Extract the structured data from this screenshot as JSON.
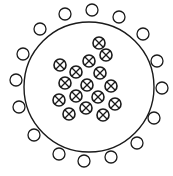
{
  "diagram": {
    "width": 173,
    "height": 176,
    "stroke_color": "#1a1a1a",
    "background": "#ffffff",
    "big_circle": {
      "cx": 89,
      "cy": 87,
      "r": 65
    },
    "outer_circle_radius": 6,
    "outer_circles": [
      [
        65,
        14
      ],
      [
        92,
        10
      ],
      [
        119,
        17
      ],
      [
        40,
        29
      ],
      [
        143,
        34
      ],
      [
        23,
        54
      ],
      [
        157,
        61
      ],
      [
        16,
        80
      ],
      [
        162,
        88
      ],
      [
        19,
        107
      ],
      [
        154,
        118
      ],
      [
        34,
        135
      ],
      [
        137,
        143
      ],
      [
        59,
        154
      ],
      [
        111,
        157
      ],
      [
        84,
        161
      ]
    ],
    "inner_symbol": "circle-with-cross",
    "inner_circle_radius": 6,
    "inner_circles": [
      [
        99,
        43
      ],
      [
        106,
        55
      ],
      [
        89,
        61
      ],
      [
        60,
        65
      ],
      [
        76,
        72
      ],
      [
        100,
        73
      ],
      [
        65,
        83
      ],
      [
        87,
        85
      ],
      [
        111,
        86
      ],
      [
        59,
        100
      ],
      [
        76,
        96
      ],
      [
        98,
        97
      ],
      [
        115,
        104
      ],
      [
        69,
        114
      ],
      [
        86,
        108
      ],
      [
        103,
        115
      ]
    ]
  }
}
